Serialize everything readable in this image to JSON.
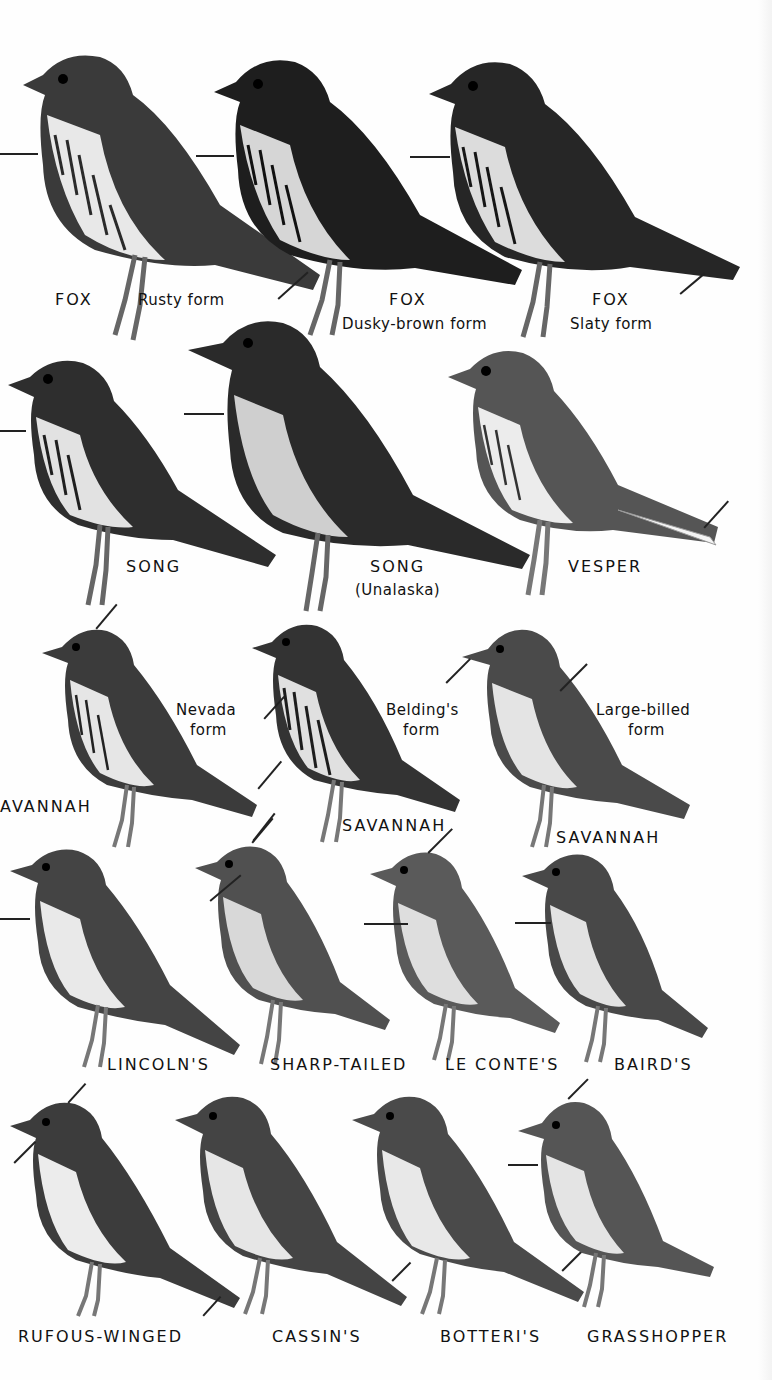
{
  "plate": {
    "background": "#fefefe",
    "ink": "#111111",
    "rows": [
      {
        "birds": [
          {
            "name": "FOX",
            "form": "Rusty form",
            "tone": "#3a3a3a"
          },
          {
            "name": "FOX",
            "form": "Dusky-brown form",
            "tone": "#1e1e1e"
          },
          {
            "name": "FOX",
            "form": "Slaty form",
            "tone": "#262626"
          }
        ]
      },
      {
        "birds": [
          {
            "name": "SONG",
            "form": "",
            "tone": "#2e2e2e"
          },
          {
            "name": "SONG",
            "form": "(Unalaska)",
            "tone": "#2a2a2a"
          },
          {
            "name": "VESPER",
            "form": "",
            "tone": "#555555"
          }
        ]
      },
      {
        "birds": [
          {
            "name": "AVANNAH",
            "form_line1": "Nevada",
            "form_line2": "form",
            "tone": "#3b3b3b"
          },
          {
            "name": "SAVANNAH",
            "form_line1": "Belding's",
            "form_line2": "form",
            "tone": "#333333"
          },
          {
            "name": "SAVANNAH",
            "form_line1": "Large-billed",
            "form_line2": "form",
            "tone": "#4a4a4a"
          }
        ]
      },
      {
        "birds": [
          {
            "name": "LINCOLN'S",
            "tone": "#444444"
          },
          {
            "name": "SHARP-TAILED",
            "tone": "#505050"
          },
          {
            "name": "LE CONTE'S",
            "tone": "#5a5a5a"
          },
          {
            "name": "BAIRD'S",
            "tone": "#484848"
          }
        ]
      },
      {
        "birds": [
          {
            "name": "RUFOUS-WINGED",
            "tone": "#3c3c3c"
          },
          {
            "name": "CASSIN'S",
            "tone": "#444444"
          },
          {
            "name": "BOTTERI'S",
            "tone": "#4a4a4a"
          },
          {
            "name": "GRASSHOPPER",
            "tone": "#555555"
          }
        ]
      }
    ]
  }
}
